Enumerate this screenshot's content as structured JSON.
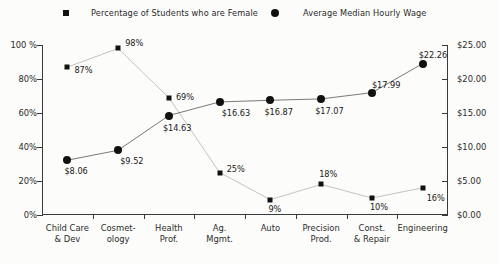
{
  "chart_data": {
    "type": "line",
    "title": "",
    "xlabel": "",
    "categories": [
      "Child Care\n& Dev",
      "Cosmet-\nology",
      "Health\nProf.",
      "Ag.\nMgmt.",
      "Auto",
      "Precision\nProd.",
      "Const.\n& Repair",
      "Engineering"
    ],
    "grid": false,
    "legend_position": "top",
    "series": [
      {
        "name": "Percentage of Students who are Female",
        "marker": "square",
        "axis": "left",
        "values": [
          87,
          98,
          69,
          25,
          9,
          18,
          10,
          16
        ],
        "labels": [
          "87%",
          "98%",
          "69%",
          "25%",
          "9%",
          "18%",
          "10%",
          "16%"
        ]
      },
      {
        "name": "Average Median Hourly Wage",
        "marker": "circle",
        "axis": "right",
        "values": [
          8.06,
          9.52,
          14.63,
          16.63,
          16.87,
          17.07,
          17.99,
          22.26
        ],
        "labels": [
          "$8.06",
          "$9.52",
          "$14.63",
          "$16.63",
          "$16.87",
          "$17.07",
          "$17.99",
          "$22.26"
        ]
      }
    ],
    "left_axis": {
      "label": "",
      "ylim": [
        0,
        100
      ],
      "ticks": [
        0,
        20,
        40,
        60,
        80,
        100
      ],
      "tick_labels": [
        "0%",
        "20%",
        "40%",
        "60%",
        "80%",
        "100 %"
      ]
    },
    "right_axis": {
      "label": "",
      "ylim": [
        0,
        25
      ],
      "ticks": [
        0,
        5,
        10,
        15,
        20,
        25
      ],
      "tick_labels": [
        "$0.00",
        "$5.00",
        "$10.00",
        "$15.00",
        "$20.00",
        "$25.00"
      ]
    }
  },
  "legend": {
    "female": {
      "label": "Percentage of Students who are Female",
      "marker": "square-marker-icon"
    },
    "wage": {
      "label": "Average Median Hourly Wage",
      "marker": "circle-marker-icon"
    }
  },
  "colors": {
    "series": "#111111",
    "axis": "#3a3a3a",
    "text": "#202020",
    "background": "#fcfcfa"
  }
}
